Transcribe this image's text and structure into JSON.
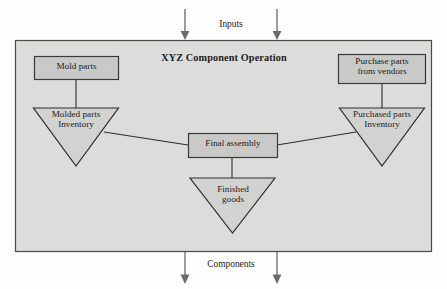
{
  "diagram": {
    "panel_title": "XYZ Component Operation",
    "flows": {
      "inputs_label": "Inputs",
      "outputs_label": "Components"
    },
    "nodes": {
      "mold_parts": "Mold parts",
      "purchase_parts": "Purchase parts\nfrom vendors",
      "molded_inventory": "Molded parts\nInventory",
      "purchased_inventory": "Purchased parts\nInventory",
      "final_assembly": "Final assembly",
      "finished_goods": "Finished\ngoods"
    },
    "colors": {
      "panel_fill": "#dcdcda",
      "panel_stroke": "#4a4a4a",
      "box_fill": "#c9c9c7",
      "box_stroke": "#3a3a3a",
      "triangle_fill": "#d2d2d0",
      "triangle_stroke": "#2e2e2e",
      "connector": "#2e2e2e",
      "arrow": "#6b6b6b",
      "text": "#1c1c1c"
    }
  }
}
